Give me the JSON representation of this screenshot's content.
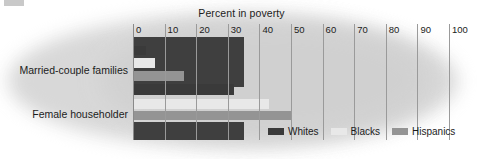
{
  "chart_data": {
    "type": "bar",
    "orientation": "horizontal",
    "title": "Percent in poverty",
    "xlabel": "",
    "ylabel": "",
    "xlim": [
      0,
      100
    ],
    "xticks": [
      0,
      10,
      20,
      30,
      40,
      50,
      60,
      70,
      80,
      90,
      100
    ],
    "xtick_labels": [
      "0",
      "10",
      "20",
      "30",
      "40",
      "50",
      "60",
      "70",
      "80",
      "90",
      "100"
    ],
    "grid": true,
    "legend_position": "bottom-right",
    "categories": [
      "Married-couple families",
      "Female householder"
    ],
    "series": [
      {
        "name": "Whites",
        "color": "#3a3a3a",
        "values": [
          4,
          32
        ]
      },
      {
        "name": "Blacks",
        "color": "#e8e8e8",
        "values": [
          7,
          43
        ]
      },
      {
        "name": "Hispanics",
        "color": "#949494",
        "values": [
          16,
          50
        ]
      }
    ],
    "annotations": []
  },
  "chart": {
    "title": "Percent in poverty",
    "legend": [
      {
        "label": "Whites",
        "color": "#3a3a3a"
      },
      {
        "label": "Blacks",
        "color": "#e8e8e8"
      },
      {
        "label": "Hispanics",
        "color": "#949494"
      }
    ],
    "category_labels": [
      "Married-couple families",
      "Female householder"
    ],
    "tick_labels": [
      "0",
      "10",
      "20",
      "30",
      "40",
      "50",
      "60",
      "70",
      "80",
      "90",
      "100"
    ],
    "colors": {
      "whites": "#3a3a3a",
      "blacks": "#e8e8e8",
      "hispanics": "#949494",
      "block": "#3f3f3f",
      "grid": "#9a9a9a",
      "background": "#ffffff",
      "blob": "#d6d6d6",
      "text": "#1c1c1c"
    }
  }
}
